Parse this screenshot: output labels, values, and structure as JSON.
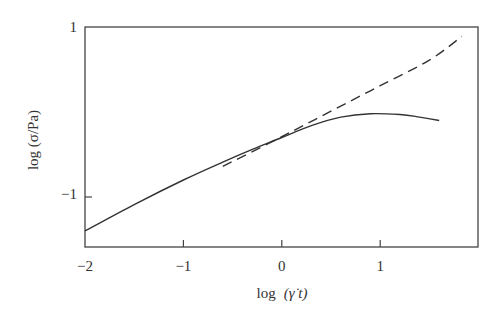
{
  "chart_data": {
    "type": "line",
    "title": "",
    "xlabel": "log (γ̇ t)",
    "ylabel": "log (σ/Pa)",
    "xlim": [
      -2,
      2
    ],
    "ylim": [
      -1.6,
      1
    ],
    "grid": false,
    "legend": null,
    "x_ticks": [
      -2,
      -1,
      0,
      1
    ],
    "x_tick_labels": [
      "−2",
      "−1",
      "0",
      "1"
    ],
    "y_ticks": [
      1,
      -1
    ],
    "y_tick_labels": [
      "1",
      "−1"
    ],
    "series": [
      {
        "name": "linear-viscoelastic (dashed)",
        "style": "dashed",
        "x": [
          -0.6,
          0,
          0.5,
          1.0,
          1.5,
          1.83
        ],
        "y": [
          -0.64,
          -0.29,
          0.01,
          0.31,
          0.61,
          0.89
        ]
      },
      {
        "name": "measured stress (solid)",
        "style": "solid",
        "x": [
          -2.0,
          -1.5,
          -1.0,
          -0.6,
          -0.3,
          0.0,
          0.3,
          0.6,
          0.9,
          1.2,
          1.4,
          1.6
        ],
        "y": [
          -1.4,
          -1.09,
          -0.8,
          -0.59,
          -0.44,
          -0.3,
          -0.16,
          -0.06,
          -0.02,
          -0.03,
          -0.06,
          -0.1
        ]
      }
    ]
  },
  "labels": {
    "xlabel_log": "log",
    "xlabel_arg": "(γ̇ t)",
    "ylabel": "log (σ/Pa)"
  }
}
